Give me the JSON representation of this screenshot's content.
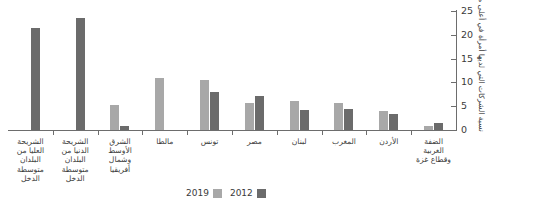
{
  "chart_data": {
    "type": "bar",
    "title": "",
    "subtitle": "",
    "xlabel": "",
    "ylabel": "نسبة الشركات التي لديها أمرأة في أعلى منصب إداري رفيع (%)",
    "ylim": [
      0,
      25
    ],
    "yticks": [
      "0",
      "5",
      "10",
      "15",
      "20",
      "25"
    ],
    "grid": false,
    "legend_position": "bottom-center",
    "direction": "rtl",
    "categories": [
      "الشريحة\nالعليا من\nالبلدان\nمتوسطة\nالدخل",
      "الشريحة\nالدنيا من\nالبلدان\nمتوسطة\nالدخل",
      "الشرق\nالأوسط\nوشمال\nأفريقيا",
      "مالطا",
      "تونس",
      "مصر",
      "لبنان",
      "المغرب",
      "الأردن",
      "الضفة\nالغربية\nوقطاع غزة"
    ],
    "series": [
      {
        "name": "2019",
        "color": "#a8a8a8",
        "values": [
          null,
          null,
          5.2,
          11.0,
          10.5,
          5.6,
          6.0,
          5.6,
          3.9,
          0.9
        ]
      },
      {
        "name": "2012",
        "color": "#6b6b6b",
        "values": [
          21.5,
          23.5,
          0.8,
          null,
          8.0,
          7.1,
          4.3,
          4.4,
          3.3,
          1.4
        ]
      }
    ]
  },
  "legend": {
    "items": [
      {
        "label": "2019",
        "color": "#a8a8a8"
      },
      {
        "label": "2012",
        "color": "#6b6b6b"
      }
    ]
  },
  "axis": {
    "line_color": "#6d6d6d",
    "text_color": "#3b3b3b"
  }
}
